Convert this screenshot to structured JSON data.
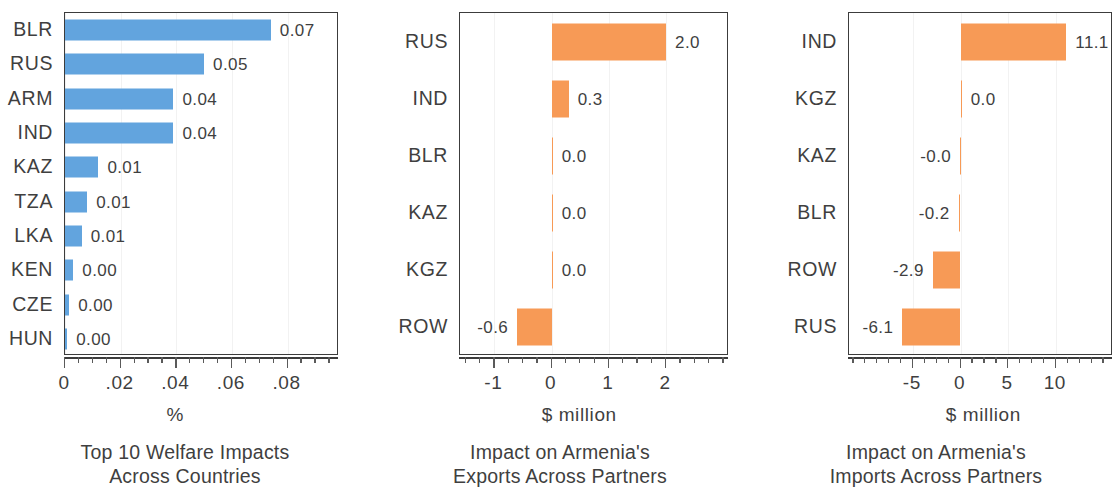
{
  "figure": {
    "width": 1112,
    "height": 500,
    "background": "#ffffff"
  },
  "colors": {
    "blue": "#62a4de",
    "orange": "#f79a56",
    "axis": "#3c3c3c",
    "text": "#3f3f3f",
    "grid": "#f2f2f2"
  },
  "chart_data": [
    {
      "type": "bar",
      "orientation": "horizontal",
      "title": "Top 10 Welfare Impacts Across Countries",
      "caption_lines": [
        "Top 10 Welfare Impacts",
        "Across Countries"
      ],
      "xlabel": "%",
      "ylabel": "",
      "categories": [
        "BLR",
        "RUS",
        "ARM",
        "IND",
        "KAZ",
        "TZA",
        "LKA",
        "KEN",
        "CZE",
        "HUN"
      ],
      "values": [
        0.074,
        0.05,
        0.039,
        0.039,
        0.012,
        0.008,
        0.006,
        0.003,
        0.0015,
        0.0008
      ],
      "data_labels": [
        "0.07",
        "0.05",
        "0.04",
        "0.04",
        "0.01",
        "0.01",
        "0.01",
        "0.00",
        "0.00",
        "0.00"
      ],
      "label_side": [
        "right",
        "right",
        "right",
        "right",
        "right",
        "right",
        "right",
        "right",
        "right",
        "right"
      ],
      "xlim": [
        0,
        0.0985
      ],
      "xticks": [
        0,
        0.02,
        0.04,
        0.06,
        0.08
      ],
      "xtick_labels": [
        "0",
        ".02",
        ".04",
        ".06",
        ".08"
      ],
      "xminor_step": 0.005,
      "grid": true,
      "bar_color": "blue",
      "legend": null
    },
    {
      "type": "bar",
      "orientation": "horizontal",
      "title": "Impact on Armenia's Exports Across Partners",
      "caption_lines": [
        "Impact on Armenia's",
        "Exports Across Partners"
      ],
      "xlabel": "$ million",
      "ylabel": "",
      "categories": [
        "RUS",
        "IND",
        "BLR",
        "KAZ",
        "KGZ",
        "ROW"
      ],
      "values": [
        2.0,
        0.3,
        0.004,
        0.004,
        0.0,
        -0.6
      ],
      "data_labels": [
        "2.0",
        "0.3",
        "0.0",
        "0.0",
        "0.0",
        "-0.6"
      ],
      "label_side": [
        "right",
        "right",
        "right",
        "right",
        "right",
        "left"
      ],
      "xlim": [
        -1.6,
        3.1
      ],
      "xticks": [
        -1,
        0,
        1,
        2
      ],
      "xtick_labels": [
        "-1",
        "0",
        "1",
        "2"
      ],
      "xminor_step": 0.25,
      "grid": true,
      "bar_color": "orange",
      "legend": null
    },
    {
      "type": "bar",
      "orientation": "horizontal",
      "title": "Impact on Armenia's Imports Across Partners",
      "caption_lines": [
        "Impact on Armenia's",
        "Imports Across Partners"
      ],
      "xlabel": "$ million",
      "ylabel": "",
      "categories": [
        "IND",
        "KGZ",
        "KAZ",
        "BLR",
        "ROW",
        "RUS"
      ],
      "values": [
        11.1,
        0.0,
        -0.04,
        -0.2,
        -2.9,
        -6.1
      ],
      "data_labels": [
        "11.1",
        "0.0",
        "-0.0",
        "-0.2",
        "-2.9",
        "-6.1"
      ],
      "label_side": [
        "right",
        "right",
        "left",
        "left",
        "left",
        "left"
      ],
      "xlim": [
        -11.7,
        16.0
      ],
      "xticks": [
        -5,
        0,
        5,
        10
      ],
      "xtick_labels": [
        "-5",
        "0",
        "5",
        "10"
      ],
      "xminor_step": 1.25,
      "grid": true,
      "bar_color": "orange",
      "legend": null
    }
  ],
  "panel_geometry": [
    {
      "plot_left": 64,
      "plot_top": 12,
      "plot_width": 274,
      "plot_height": 343,
      "bar_thickness": 21,
      "axis_y": 357
    },
    {
      "plot_left": 79,
      "plot_top": 12,
      "plot_width": 269,
      "plot_height": 343,
      "bar_thickness": 37,
      "axis_y": 357
    },
    {
      "plot_left": 88,
      "plot_top": 12,
      "plot_width": 264,
      "plot_height": 343,
      "bar_thickness": 37,
      "axis_y": 357
    }
  ]
}
